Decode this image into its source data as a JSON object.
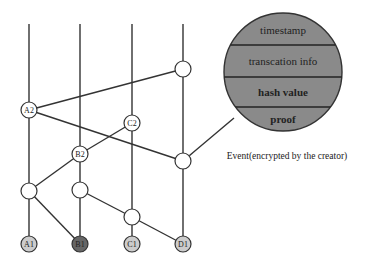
{
  "diagram": {
    "lanes": [
      {
        "id": "A",
        "x": 29
      },
      {
        "id": "B",
        "x": 80
      },
      {
        "id": "C",
        "x": 132
      },
      {
        "id": "D",
        "x": 183
      }
    ],
    "nodes": {
      "A1": {
        "label": "A1",
        "fill": "#cccccc"
      },
      "B1": {
        "label": "B1",
        "fill": "#666666"
      },
      "C1": {
        "label": "C1",
        "fill": "#cccccc"
      },
      "D1": {
        "label": "D1",
        "fill": "#cccccc"
      },
      "A2": {
        "label": "A2"
      },
      "B2": {
        "label": "B2"
      },
      "C2": {
        "label": "C2"
      }
    },
    "event_detail": {
      "fields": [
        "timestamp",
        "transcation info",
        "hash value",
        "proof"
      ],
      "fill": "#8a8a8a",
      "caption": "Event(encrypted by the creator)"
    }
  }
}
